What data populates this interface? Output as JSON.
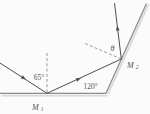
{
  "diagram": {
    "labels": {
      "incidence_angle": "65°",
      "mirrors_angle": "120°",
      "theta": "θ",
      "mirror1_base": "M",
      "mirror1_sub": "1",
      "mirror2_base": "M",
      "mirror2_sub": "2"
    },
    "colors": {
      "ray": "#4f4f4f",
      "mirror": "#8c8c8c",
      "mirror-shadow": "#d9d9d9",
      "dashed": "#8f8f8f",
      "text": "#555555",
      "bg": "#fbfbfb"
    }
  }
}
